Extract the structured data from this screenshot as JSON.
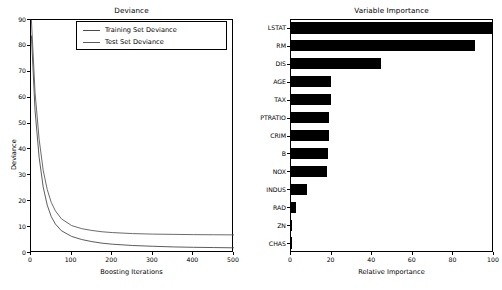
{
  "figure": {
    "background": "#ffffff",
    "width": 502,
    "height": 290
  },
  "chart_data": [
    {
      "type": "line",
      "title": "Deviance",
      "xlabel": "Boosting Iterations",
      "ylabel": "Deviance",
      "xlim": [
        0,
        500
      ],
      "ylim": [
        0,
        90
      ],
      "xticks": [
        0,
        100,
        200,
        300,
        400,
        500
      ],
      "yticks": [
        0,
        10,
        20,
        30,
        40,
        50,
        60,
        70,
        80,
        90
      ],
      "grid": false,
      "legend_position": "upper right",
      "series": [
        {
          "name": "Training Set Deviance",
          "color": "#4a4a4a",
          "x": [
            1,
            10,
            20,
            30,
            40,
            50,
            60,
            75,
            100,
            125,
            150,
            175,
            200,
            250,
            300,
            350,
            400,
            450,
            500
          ],
          "y": [
            84.0,
            55.0,
            37.0,
            25.5,
            18.5,
            14.0,
            11.2,
            8.6,
            6.4,
            5.2,
            4.4,
            3.8,
            3.4,
            2.9,
            2.6,
            2.35,
            2.2,
            2.1,
            2.0
          ]
        },
        {
          "name": "Test Set Deviance",
          "color": "#5a5a5a",
          "x": [
            1,
            10,
            20,
            30,
            40,
            50,
            60,
            75,
            100,
            125,
            150,
            175,
            200,
            250,
            300,
            350,
            400,
            450,
            500
          ],
          "y": [
            90.0,
            62.0,
            44.0,
            32.0,
            24.5,
            19.5,
            16.3,
            13.2,
            10.6,
            9.4,
            8.7,
            8.2,
            7.9,
            7.5,
            7.3,
            7.2,
            7.1,
            7.05,
            7.0
          ]
        }
      ]
    },
    {
      "type": "bar",
      "orientation": "horizontal",
      "title": "Variable Importance",
      "xlabel": "Relative Importance",
      "ylabel": "",
      "xlim": [
        0,
        100
      ],
      "xticks": [
        0,
        20,
        40,
        60,
        80,
        100
      ],
      "grid": false,
      "bar_color": "#000000",
      "categories": [
        "CHAS",
        "ZN",
        "RAD",
        "INDUS",
        "NOX",
        "B",
        "CRIM",
        "PTRATIO",
        "TAX",
        "AGE",
        "DIS",
        "RM",
        "LSTAT"
      ],
      "values": [
        0.2,
        1.0,
        3.2,
        8.5,
        18.0,
        18.6,
        19.2,
        19.4,
        20.0,
        20.2,
        45.0,
        91.0,
        100.0
      ]
    }
  ]
}
